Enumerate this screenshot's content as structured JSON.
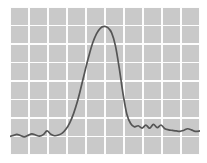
{
  "chart_data": {
    "type": "line",
    "title": "",
    "subtitle": "",
    "xlabel": "",
    "ylabel": "",
    "grid": true,
    "grid_columns": 10,
    "grid_rows": 8,
    "legend": "none",
    "legend_position": "none",
    "xlim": [
      0,
      10
    ],
    "ylim": [
      0,
      8
    ],
    "xticks": [
      0,
      1,
      2,
      3,
      4,
      5,
      6,
      7,
      8,
      9,
      10
    ],
    "yticks": [
      0,
      1,
      2,
      3,
      4,
      5,
      6,
      7,
      8
    ],
    "xticklabels": [],
    "yticklabels": [],
    "annotations": [],
    "colors": {
      "plot_background": "#c9c9c9",
      "grid_line": "#fdfdfd",
      "trace_line": "#555555",
      "figure_background": "#ffffff"
    },
    "series": [
      {
        "name": "signal",
        "color": "#555555",
        "x": [
          0.0,
          0.18,
          0.36,
          0.55,
          0.75,
          0.95,
          1.15,
          1.35,
          1.55,
          1.75,
          1.95,
          2.15,
          2.35,
          2.55,
          2.75,
          2.95,
          3.15,
          3.35,
          3.55,
          3.75,
          3.95,
          4.15,
          4.35,
          4.55,
          4.75,
          4.95,
          5.15,
          5.35,
          5.55,
          5.75,
          5.95,
          6.15,
          6.35,
          6.55,
          6.75,
          6.95,
          7.15,
          7.35,
          7.55,
          7.75,
          7.95,
          8.15,
          8.35,
          8.55,
          8.75,
          8.95,
          9.15,
          9.35,
          9.55,
          9.75,
          10.0
        ],
        "y": [
          1.0,
          1.06,
          1.12,
          1.05,
          0.98,
          1.06,
          1.14,
          1.08,
          1.02,
          1.1,
          1.3,
          1.12,
          1.04,
          1.08,
          1.18,
          1.4,
          1.75,
          2.25,
          2.9,
          3.7,
          4.55,
          5.35,
          6.05,
          6.55,
          6.85,
          6.95,
          6.88,
          6.6,
          5.9,
          4.7,
          3.3,
          2.2,
          1.7,
          1.52,
          1.58,
          1.45,
          1.62,
          1.45,
          1.66,
          1.48,
          1.62,
          1.42,
          1.36,
          1.33,
          1.3,
          1.28,
          1.34,
          1.42,
          1.36,
          1.28,
          1.3
        ]
      }
    ]
  },
  "figure": {
    "caption": "",
    "x_axis_visible": false,
    "y_axis_visible": false,
    "frame_visible": false
  }
}
